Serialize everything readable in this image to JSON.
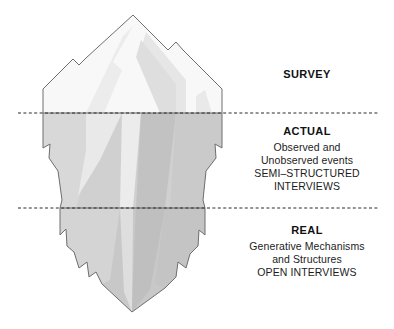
{
  "figure": {
    "type": "iceberg-metaphor-diagram",
    "title_visible": false
  },
  "colors": {
    "outline": "#6b6b6b",
    "waterline": "#2b2b2b",
    "above_water_base": "#f7f7f7",
    "above_water_facet_light": "#ededed",
    "above_water_facet_mid": "#e0e0e0",
    "below_water_base": "#cfcfcf",
    "below_water_facet_light": "#e6e6e6",
    "below_water_facet_dark": "#bdbdbd",
    "deep_base": "#c6c6c6",
    "text": "#1a1a1a",
    "background": "#ffffff"
  },
  "waterlines": [
    {
      "name": "survey-actual-boundary",
      "y": 113
    },
    {
      "name": "actual-real-boundary",
      "y": 208
    }
  ],
  "layers": [
    {
      "id": "survey",
      "heading": "SURVEY",
      "lines": []
    },
    {
      "id": "actual",
      "heading": "ACTUAL",
      "lines": [
        "Observed and",
        "Unobserved events",
        "SEMI–STRUCTURED",
        "INTERVIEWS"
      ]
    },
    {
      "id": "real",
      "heading": "REAL",
      "lines": [
        "Generative Mechanisms",
        "and Structures",
        "OPEN INTERVIEWS"
      ]
    }
  ]
}
